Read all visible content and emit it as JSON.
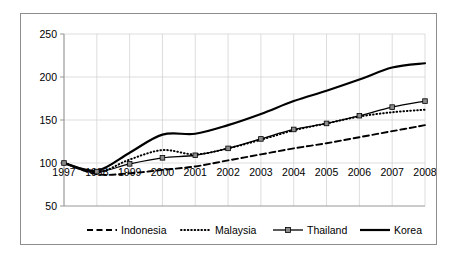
{
  "chart_data": {
    "type": "line",
    "title": "",
    "subtitle": "",
    "xlabel": "",
    "ylabel": "",
    "xlim": [
      1997,
      2008
    ],
    "ylim": [
      50,
      250
    ],
    "yticks": [
      50,
      100,
      150,
      200,
      250
    ],
    "ytick_labels": [
      "50",
      "100",
      "150",
      "200",
      "250"
    ],
    "grid": true,
    "legend_position": "bottom",
    "categories": [
      1997,
      1998,
      1999,
      2000,
      2001,
      2002,
      2003,
      2004,
      2005,
      2006,
      2007,
      2008
    ],
    "xtick_labels": [
      "1997",
      "1998",
      "1999",
      "2000",
      "2001",
      "2002",
      "2003",
      "2004",
      "2005",
      "2006",
      "2007",
      "2008"
    ],
    "series": [
      {
        "name": "Indonesia",
        "style": "dashed",
        "marker": "none",
        "color": "#000000",
        "values": [
          100,
          87,
          88,
          92,
          96,
          103,
          110,
          117,
          123,
          130,
          137,
          144
        ]
      },
      {
        "name": "Malaysia",
        "style": "dotted",
        "marker": "none",
        "color": "#000000",
        "values": [
          100,
          89,
          104,
          115,
          110,
          117,
          127,
          138,
          146,
          154,
          159,
          162
        ]
      },
      {
        "name": "Thailand",
        "style": "solid",
        "marker": "square",
        "color": "#000000",
        "values": [
          100,
          90,
          99,
          106,
          109,
          117,
          128,
          139,
          146,
          155,
          165,
          172
        ]
      },
      {
        "name": "Korea",
        "style": "solid-thick",
        "marker": "none",
        "color": "#000000",
        "values": [
          100,
          91,
          112,
          133,
          134,
          144,
          157,
          172,
          184,
          197,
          211,
          216
        ]
      }
    ]
  },
  "legend": {
    "items": [
      {
        "label": "Indonesia",
        "style": "dashed"
      },
      {
        "label": "Malaysia",
        "style": "dotted"
      },
      {
        "label": "Thailand",
        "style": "solid-marker"
      },
      {
        "label": "Korea",
        "style": "solid-thick"
      }
    ]
  }
}
